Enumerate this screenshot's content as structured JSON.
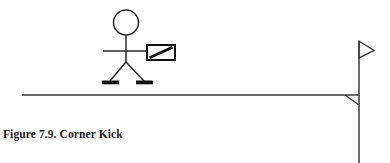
{
  "figure": {
    "caption": "Figure 7.9. Corner Kick",
    "colors": {
      "ink": "#2b2b2b",
      "ink_solid": "#111111",
      "background": "#ffffff"
    },
    "canvas": {
      "width": 390,
      "height": 163
    },
    "scene": {
      "ground_line": {
        "label": "touchline",
        "x1": 22,
        "y1": 95,
        "x2": 359,
        "y2": 95,
        "stroke_width": 1.2
      },
      "referee": {
        "label": "assistant referee raising flag",
        "head": {
          "cx": 126,
          "cy": 22.5,
          "r": 12.5
        },
        "torso": {
          "x1": 126,
          "y1": 35,
          "x2": 126,
          "y2": 62
        },
        "arm": {
          "x1": 103,
          "y1": 51,
          "x2": 148,
          "y2": 51
        },
        "leg_left": {
          "x1": 126,
          "y1": 62,
          "x2": 110,
          "y2": 81
        },
        "leg_right": {
          "x1": 126,
          "y1": 62,
          "x2": 144,
          "y2": 81
        },
        "foot_left": {
          "x": 102,
          "y": 80.5,
          "width": 17,
          "height": 3.6
        },
        "foot_right": {
          "x": 136,
          "y": 80.5,
          "width": 17,
          "height": 3.6
        }
      },
      "hand_flag": {
        "label": "signal flag",
        "rect": {
          "x": 147,
          "y": 45,
          "width": 28,
          "height": 15
        },
        "diagonal": {
          "x1": 149,
          "y1": 58,
          "x2": 173,
          "y2": 47
        },
        "border_width": 2,
        "diagonal_width": 2.4
      },
      "corner_post": {
        "label": "corner flag post",
        "pole": {
          "x1": 359,
          "y1": 41,
          "x2": 359,
          "y2": 163
        },
        "pennant": {
          "points": "359,41 374,50 359,58"
        },
        "corner_marker": {
          "points": "345,95 359,95 359,105"
        }
      }
    }
  }
}
